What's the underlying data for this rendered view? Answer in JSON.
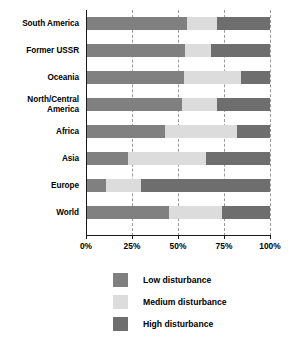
{
  "chart_data": {
    "type": "bar",
    "orientation": "horizontal",
    "stacked": true,
    "normalized_percent": true,
    "title": "",
    "subtitle": "",
    "xlabel": "",
    "ylabel": "",
    "xlim": [
      0,
      100
    ],
    "grid": true,
    "grid_style": "dashed vertical",
    "legend_position": "bottom-center",
    "categories": [
      "South America",
      "Former USSR",
      "Oceania",
      "North/Central America",
      "Africa",
      "Asia",
      "Europe",
      "World"
    ],
    "xticks": [
      0,
      25,
      50,
      75,
      100
    ],
    "xticklabels": [
      "0%",
      "25%",
      "50%",
      "75%",
      "100%"
    ],
    "series": [
      {
        "name": "Low disturbance",
        "color": "#808080",
        "values": [
          55,
          54,
          53,
          52,
          43,
          23,
          11,
          45
        ]
      },
      {
        "name": "Medium disturbance",
        "color": "#dcdcdc",
        "values": [
          16,
          14,
          31,
          19,
          39,
          42,
          19,
          29
        ]
      },
      {
        "name": "High disturbance",
        "color": "#6e6e6e",
        "values": [
          29,
          32,
          16,
          29,
          18,
          35,
          70,
          26
        ]
      }
    ],
    "rows": [
      {
        "label": "South America",
        "low": 55,
        "medium": 16,
        "high": 29
      },
      {
        "label": "Former USSR",
        "low": 54,
        "medium": 14,
        "high": 32
      },
      {
        "label": "Oceania",
        "low": 53,
        "medium": 31,
        "high": 16
      },
      {
        "label": "North/Central America",
        "low": 52,
        "medium": 19,
        "high": 29
      },
      {
        "label": "Africa",
        "low": 43,
        "medium": 39,
        "high": 18
      },
      {
        "label": "Asia",
        "low": 23,
        "medium": 42,
        "high": 35
      },
      {
        "label": "Europe",
        "low": 11,
        "medium": 19,
        "high": 70
      },
      {
        "label": "World",
        "low": 45,
        "medium": 29,
        "high": 26
      }
    ]
  },
  "axis": {
    "ticks": [
      {
        "label": "0%",
        "value": 0
      },
      {
        "label": "25%",
        "value": 25
      },
      {
        "label": "50%",
        "value": 50
      },
      {
        "label": "75%",
        "value": 75
      },
      {
        "label": "100%",
        "value": 100
      }
    ]
  },
  "legend": {
    "items": [
      {
        "label": "Low disturbance",
        "color": "#808080"
      },
      {
        "label": "Medium disturbance",
        "color": "#dcdcdc"
      },
      {
        "label": "High disturbance",
        "color": "#6e6e6e"
      }
    ]
  }
}
